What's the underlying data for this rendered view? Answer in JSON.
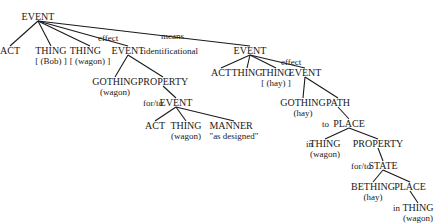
{
  "diagram": {
    "type": "conceptual-structure-tree",
    "nodes": [
      {
        "id": "n0",
        "label": "EVENT",
        "sub": "",
        "x": 38,
        "y": 12
      },
      {
        "id": "n1",
        "label": "ACT",
        "sub": "",
        "x": 10,
        "y": 46
      },
      {
        "id": "n2",
        "label": "THING",
        "sub": "[ (Bob) ]",
        "x": 51,
        "y": 46
      },
      {
        "id": "n3",
        "label": "THING",
        "sub": "[ (wagon) ]",
        "x": 90,
        "y": 46
      },
      {
        "id": "n4",
        "label": "EVENT",
        "sub": "",
        "x": 128,
        "y": 46
      },
      {
        "id": "n5",
        "label": "GOTHING",
        "sub": "(wagon)",
        "x": 115,
        "y": 77
      },
      {
        "id": "n6",
        "label": "PROPERTY",
        "sub": "",
        "x": 163,
        "y": 77
      },
      {
        "id": "n7",
        "label": "EVENT",
        "sub": "",
        "x": 176,
        "y": 98
      },
      {
        "id": "n8",
        "label": "ACT",
        "sub": "",
        "x": 155,
        "y": 121
      },
      {
        "id": "n9",
        "label": "THING",
        "sub": "(wagon)",
        "x": 186,
        "y": 121
      },
      {
        "id": "n10",
        "label": "MANNER",
        "sub": "\"as designed\"",
        "x": 234,
        "y": 121
      },
      {
        "id": "n11",
        "label": "EVENT",
        "sub": "",
        "x": 250,
        "y": 46
      },
      {
        "id": "n12",
        "label": "ACT",
        "sub": "",
        "x": 221,
        "y": 68
      },
      {
        "id": "n13",
        "label": "THING",
        "sub": "",
        "x": 247,
        "y": 68
      },
      {
        "id": "n14",
        "label": "THING",
        "sub": "[ (hay) ]",
        "x": 276,
        "y": 68
      },
      {
        "id": "n15",
        "label": "EVENT",
        "sub": "",
        "x": 305,
        "y": 68
      },
      {
        "id": "n16",
        "label": "GOTHING",
        "sub": "(hay)",
        "x": 303,
        "y": 98
      },
      {
        "id": "n17",
        "label": "PATH",
        "sub": "",
        "x": 338,
        "y": 98
      },
      {
        "id": "n18",
        "label": "PLACE",
        "sub": "",
        "x": 349,
        "y": 119
      },
      {
        "id": "n19",
        "label": "THING",
        "sub": "(wagon)",
        "x": 325,
        "y": 139
      },
      {
        "id": "n20",
        "label": "PROPERTY",
        "sub": "",
        "x": 378,
        "y": 139
      },
      {
        "id": "n21",
        "label": "STATE",
        "sub": "",
        "x": 383,
        "y": 161
      },
      {
        "id": "n22",
        "label": "BETHING",
        "sub": "(hay)",
        "x": 373,
        "y": 182
      },
      {
        "id": "n23",
        "label": "PLACE",
        "sub": "",
        "x": 410,
        "y": 182
      },
      {
        "id": "n24",
        "label": "THING",
        "sub": "(wagon)",
        "x": 418,
        "y": 203
      }
    ],
    "edges": [
      {
        "from": "n0",
        "to": "n1"
      },
      {
        "from": "n0",
        "to": "n2"
      },
      {
        "from": "n0",
        "to": "n3"
      },
      {
        "from": "n0",
        "to": "n4"
      },
      {
        "from": "n0",
        "to": "n11"
      },
      {
        "from": "n4",
        "to": "n5"
      },
      {
        "from": "n4",
        "to": "n6"
      },
      {
        "from": "n6",
        "to": "n7"
      },
      {
        "from": "n7",
        "to": "n8"
      },
      {
        "from": "n7",
        "to": "n9"
      },
      {
        "from": "n7",
        "to": "n10"
      },
      {
        "from": "n11",
        "to": "n12"
      },
      {
        "from": "n11",
        "to": "n13"
      },
      {
        "from": "n11",
        "to": "n14"
      },
      {
        "from": "n11",
        "to": "n15"
      },
      {
        "from": "n15",
        "to": "n16"
      },
      {
        "from": "n15",
        "to": "n17"
      },
      {
        "from": "n17",
        "to": "n18"
      },
      {
        "from": "n18",
        "to": "n19"
      },
      {
        "from": "n18",
        "to": "n20"
      },
      {
        "from": "n20",
        "to": "n21"
      },
      {
        "from": "n21",
        "to": "n22"
      },
      {
        "from": "n21",
        "to": "n23"
      },
      {
        "from": "n23",
        "to": "n24"
      }
    ],
    "edge_labels": [
      {
        "text": "effect",
        "x": 98,
        "y": 34
      },
      {
        "text": "means",
        "x": 161,
        "y": 32
      },
      {
        "text": ":identificational",
        "x": 141,
        "y": 47
      },
      {
        "text": "effect",
        "x": 281,
        "y": 58
      },
      {
        "text": "for/to",
        "x": 143,
        "y": 99
      },
      {
        "text": "to",
        "x": 322,
        "y": 120
      },
      {
        "text": "in",
        "x": 306,
        "y": 140
      },
      {
        "text": "for/to",
        "x": 351,
        "y": 162
      },
      {
        "text": "in",
        "x": 393,
        "y": 204
      }
    ],
    "line_color": "#1a1a1a",
    "text_color": "#1a1a1a"
  }
}
